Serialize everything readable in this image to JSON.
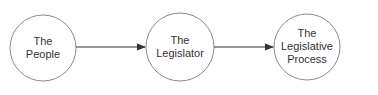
{
  "diagram": {
    "type": "flow",
    "nodes": [
      {
        "id": "people",
        "lines": [
          "The",
          "People"
        ],
        "cx": 43,
        "cy": 48,
        "r": 33
      },
      {
        "id": "legislator",
        "lines": [
          "The",
          "Legislator"
        ],
        "cx": 180,
        "cy": 47,
        "r": 34
      },
      {
        "id": "process",
        "lines": [
          "The",
          "Legislative",
          "Process"
        ],
        "cx": 307,
        "cy": 47,
        "r": 33
      }
    ],
    "edges": [
      {
        "from": "people",
        "to": "legislator"
      },
      {
        "from": "legislator",
        "to": "process"
      }
    ],
    "colors": {
      "stroke": "#8a8a8a",
      "arrow": "#333333",
      "text": "#333333"
    }
  }
}
